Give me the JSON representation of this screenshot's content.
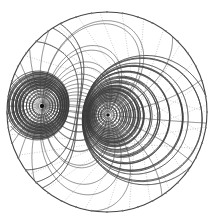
{
  "figure": {
    "colors": {
      "ink": "#333333",
      "light_ink": "#888888",
      "background": "#ffffff"
    },
    "boundary": {
      "cx": 107,
      "cy": 112,
      "r": 100
    },
    "poles": [
      {
        "name": "left-pole",
        "x": 42,
        "y": 106
      },
      {
        "name": "right-pole",
        "x": 108,
        "y": 115
      }
    ],
    "labels_note": "Tiny numeric labels along curves are illegible at this resolution"
  }
}
